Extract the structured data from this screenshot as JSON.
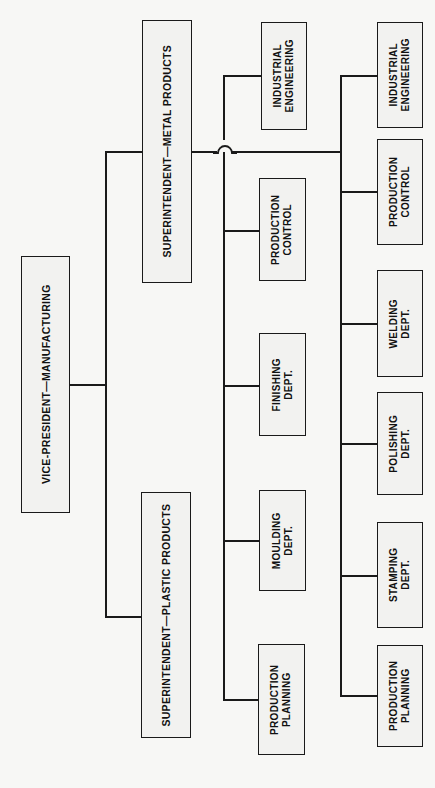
{
  "chart": {
    "orientation": "rotated-vertical-text",
    "line_color": "#1a1a1a",
    "box_fill": "#f2f2f0",
    "background": "#f7f7f5",
    "levels": [
      {
        "level": 1,
        "nodes": [
          {
            "id": "vp",
            "label": "VICE-PRESIDENT—MANUFACTURING"
          }
        ]
      },
      {
        "level": 2,
        "nodes": [
          {
            "id": "supt_metal",
            "label": "SUPERINTENDENT—METAL PRODUCTS"
          },
          {
            "id": "supt_plastic",
            "label": "SUPERINTENDENT—PLASTIC PRODUCTS"
          }
        ]
      },
      {
        "level": 3,
        "nodes": [
          {
            "id": "l3_ie",
            "line1": "INDUSTRIAL",
            "line2": "ENGINEERING"
          },
          {
            "id": "l3_pc",
            "line1": "PRODUCTION",
            "line2": "CONTROL"
          },
          {
            "id": "l3_fin",
            "line1": "FINISHING",
            "line2": "DEPT."
          },
          {
            "id": "l3_mould",
            "line1": "MOULDING",
            "line2": "DEPT."
          },
          {
            "id": "l3_pp",
            "line1": "PRODUCTION",
            "line2": "PLANNING"
          }
        ]
      },
      {
        "level": 4,
        "nodes": [
          {
            "id": "l4_ie",
            "line1": "INDUSTRIAL",
            "line2": "ENGINEERING"
          },
          {
            "id": "l4_pc",
            "line1": "PRODUCTION",
            "line2": "CONTROL"
          },
          {
            "id": "l4_weld",
            "line1": "WELDING",
            "line2": "DEPT."
          },
          {
            "id": "l4_pol",
            "line1": "POLISHING",
            "line2": "DEPT."
          },
          {
            "id": "l4_stamp",
            "line1": "STAMPING",
            "line2": "DEPT."
          },
          {
            "id": "l4_pp",
            "line1": "PRODUCTION",
            "line2": "PLANNING"
          }
        ]
      }
    ]
  }
}
